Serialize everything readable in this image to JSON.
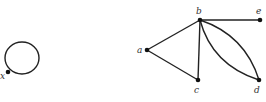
{
  "diagram": {
    "type": "graph",
    "graphs": [
      {
        "name": "loop-graph",
        "vertices": [
          {
            "id": "x",
            "label": "x",
            "cx": 8,
            "cy": 72
          }
        ],
        "edges": [
          {
            "from": "x",
            "to": "x",
            "kind": "loop"
          }
        ]
      },
      {
        "name": "multigraph",
        "vertices": [
          {
            "id": "a",
            "label": "a",
            "cx": 147,
            "cy": 50
          },
          {
            "id": "b",
            "label": "b",
            "cx": 200,
            "cy": 20
          },
          {
            "id": "c",
            "label": "c",
            "cx": 198,
            "cy": 80
          },
          {
            "id": "d",
            "label": "d",
            "cx": 259,
            "cy": 80
          },
          {
            "id": "e",
            "label": "e",
            "cx": 260,
            "cy": 20
          }
        ],
        "edges": [
          {
            "from": "a",
            "to": "b"
          },
          {
            "from": "a",
            "to": "c"
          },
          {
            "from": "b",
            "to": "c"
          },
          {
            "from": "b",
            "to": "e"
          },
          {
            "from": "b",
            "to": "d",
            "kind": "curve-upper"
          },
          {
            "from": "b",
            "to": "d",
            "kind": "curve-lower"
          }
        ]
      }
    ]
  }
}
